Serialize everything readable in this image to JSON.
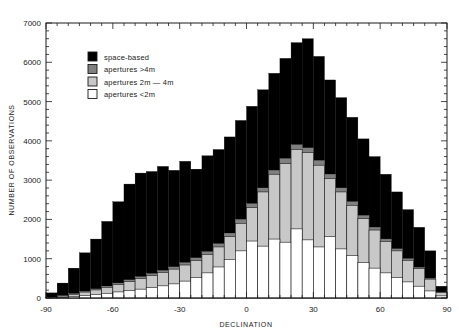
{
  "chart_data": {
    "type": "bar",
    "subtype": "stacked-step-histogram",
    "title": "",
    "subtitle": "",
    "xlabel": "DECLINATION",
    "ylabel": "NUMBER OF OBSERVATIONS",
    "xlim": [
      -90,
      90
    ],
    "ylim": [
      0,
      7000
    ],
    "xticks": [
      -90,
      -60,
      -30,
      0,
      30,
      60,
      90
    ],
    "xtick_labels": [
      "-90",
      "-60",
      "-30",
      "0",
      "30",
      "60",
      "90"
    ],
    "yticks": [
      0,
      1000,
      2000,
      3000,
      4000,
      5000,
      6000,
      7000
    ],
    "ytick_labels": [
      "0",
      "1000",
      "2000",
      "3000",
      "4000",
      "5000",
      "6000",
      "7000"
    ],
    "grid": false,
    "legend_position": "upper-left-inside",
    "bin_width": 5,
    "bin_starts": [
      -90,
      -85,
      -80,
      -75,
      -70,
      -65,
      -60,
      -55,
      -50,
      -45,
      -40,
      -35,
      -30,
      -25,
      -20,
      -15,
      -10,
      -5,
      0,
      5,
      10,
      15,
      20,
      25,
      30,
      35,
      40,
      45,
      50,
      55,
      60,
      65,
      70,
      75,
      80,
      85
    ],
    "legend": [
      {
        "label": "space-based",
        "color": "#000000"
      },
      {
        "label": "apertures >4m",
        "color": "#808080"
      },
      {
        "label": "apertures 2m — 4m",
        "color": "#c8c8c8"
      },
      {
        "label": "apertures <2m",
        "color": "#ffffff"
      }
    ],
    "series": [
      {
        "name": "space-based",
        "color": "#000000",
        "description": "total stacked height (cumulative top of all categories)",
        "values": [
          130,
          380,
          760,
          1150,
          1500,
          1950,
          2450,
          2900,
          3180,
          3220,
          3350,
          3250,
          3480,
          3280,
          3620,
          3780,
          4100,
          4520,
          4880,
          5300,
          5720,
          6100,
          6500,
          6600,
          6150,
          5550,
          5100,
          4600,
          4050,
          3600,
          3150,
          2700,
          2250,
          1800,
          1200,
          300
        ]
      },
      {
        "name": "apertures >4m",
        "color": "#808080",
        "description": "cumulative top of >4m + 2m-4m + <2m",
        "values": [
          20,
          60,
          110,
          170,
          230,
          300,
          380,
          460,
          540,
          620,
          700,
          790,
          900,
          1020,
          1180,
          1380,
          1650,
          2000,
          2400,
          2800,
          3250,
          3550,
          3900,
          3820,
          3500,
          3150,
          2800,
          2450,
          2100,
          1800,
          1500,
          1250,
          1000,
          780,
          500,
          150
        ]
      },
      {
        "name": "apertures 2m - 4m",
        "color": "#c8c8c8",
        "description": "cumulative top of 2m-4m + <2m",
        "values": [
          15,
          50,
          95,
          150,
          205,
          270,
          345,
          420,
          495,
          570,
          650,
          735,
          840,
          955,
          1110,
          1300,
          1560,
          1900,
          2300,
          2700,
          3150,
          3420,
          3780,
          3700,
          3380,
          3040,
          2700,
          2360,
          2020,
          1730,
          1440,
          1200,
          960,
          750,
          480,
          140
        ]
      },
      {
        "name": "apertures <2m",
        "color": "#ffffff",
        "description": "bottom white layer only",
        "values": [
          8,
          20,
          40,
          65,
          90,
          120,
          155,
          190,
          225,
          265,
          310,
          360,
          430,
          520,
          640,
          790,
          980,
          1200,
          1450,
          1320,
          1500,
          1420,
          1760,
          1480,
          1300,
          1560,
          1250,
          1080,
          900,
          760,
          640,
          520,
          410,
          300,
          180,
          55
        ]
      }
    ]
  },
  "axes": {
    "y_title": "NUMBER OF OBSERVATIONS",
    "x_title": "DECLINATION"
  },
  "colors": {
    "space_based": "#000000",
    "aperture_gt4m": "#808080",
    "aperture_2m_4m": "#c8c8c8",
    "aperture_lt2m": "#ffffff",
    "frame": "#1a1a1a",
    "background": "#ffffff"
  }
}
